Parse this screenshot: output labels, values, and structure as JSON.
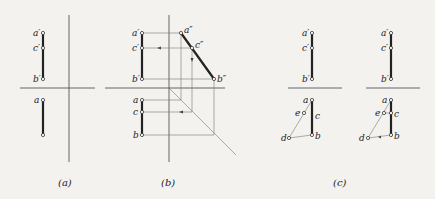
{
  "figure": {
    "panels": [
      {
        "caption": "(a)",
        "points": {
          "a_prime": "a′",
          "c_prime": "c′",
          "b_prime": "b′",
          "a": "a"
        }
      },
      {
        "caption": "(b)",
        "points": {
          "a_prime": "a′",
          "c_prime": "c′",
          "b_prime": "b′",
          "a_dprime": "a″",
          "c_dprime": "c″",
          "b_dprime": "b″",
          "a": "a",
          "c": "c",
          "b": "b"
        }
      },
      {
        "caption": "(c)",
        "left": {
          "points": {
            "a_prime": "a′",
            "c_prime": "c′",
            "b_prime": "b′",
            "a": "a",
            "e": "e",
            "c": "c",
            "d": "d",
            "b": "b"
          }
        },
        "right": {
          "points": {
            "a_prime": "a′",
            "c_prime": "c′",
            "b_prime": "b′",
            "a": "a",
            "e": "e",
            "c": "c",
            "d": "d",
            "b": "b"
          }
        }
      }
    ]
  }
}
